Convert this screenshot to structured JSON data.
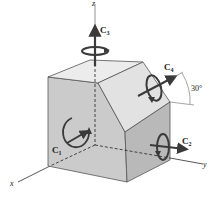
{
  "diagram": {
    "axes": {
      "x": "x",
      "y": "y",
      "z": "z"
    },
    "moments": [
      {
        "name": "C",
        "sub": "1",
        "position": "front face, about x-axis"
      },
      {
        "name": "C",
        "sub": "2",
        "position": "right face, along y-axis"
      },
      {
        "name": "C",
        "sub": "3",
        "position": "top, along z-axis"
      },
      {
        "name": "C",
        "sub": "4",
        "position": "inclined face, 30° above y"
      }
    ],
    "angle_label": "30°",
    "colors": {
      "top_face": "#e9e9e9",
      "front_face": "#c9c9c9",
      "right_face": "#b8b8b8",
      "chamfer_face": "#e1e1e1",
      "arrow": "#3a3a3a",
      "edge": "#555555"
    }
  }
}
